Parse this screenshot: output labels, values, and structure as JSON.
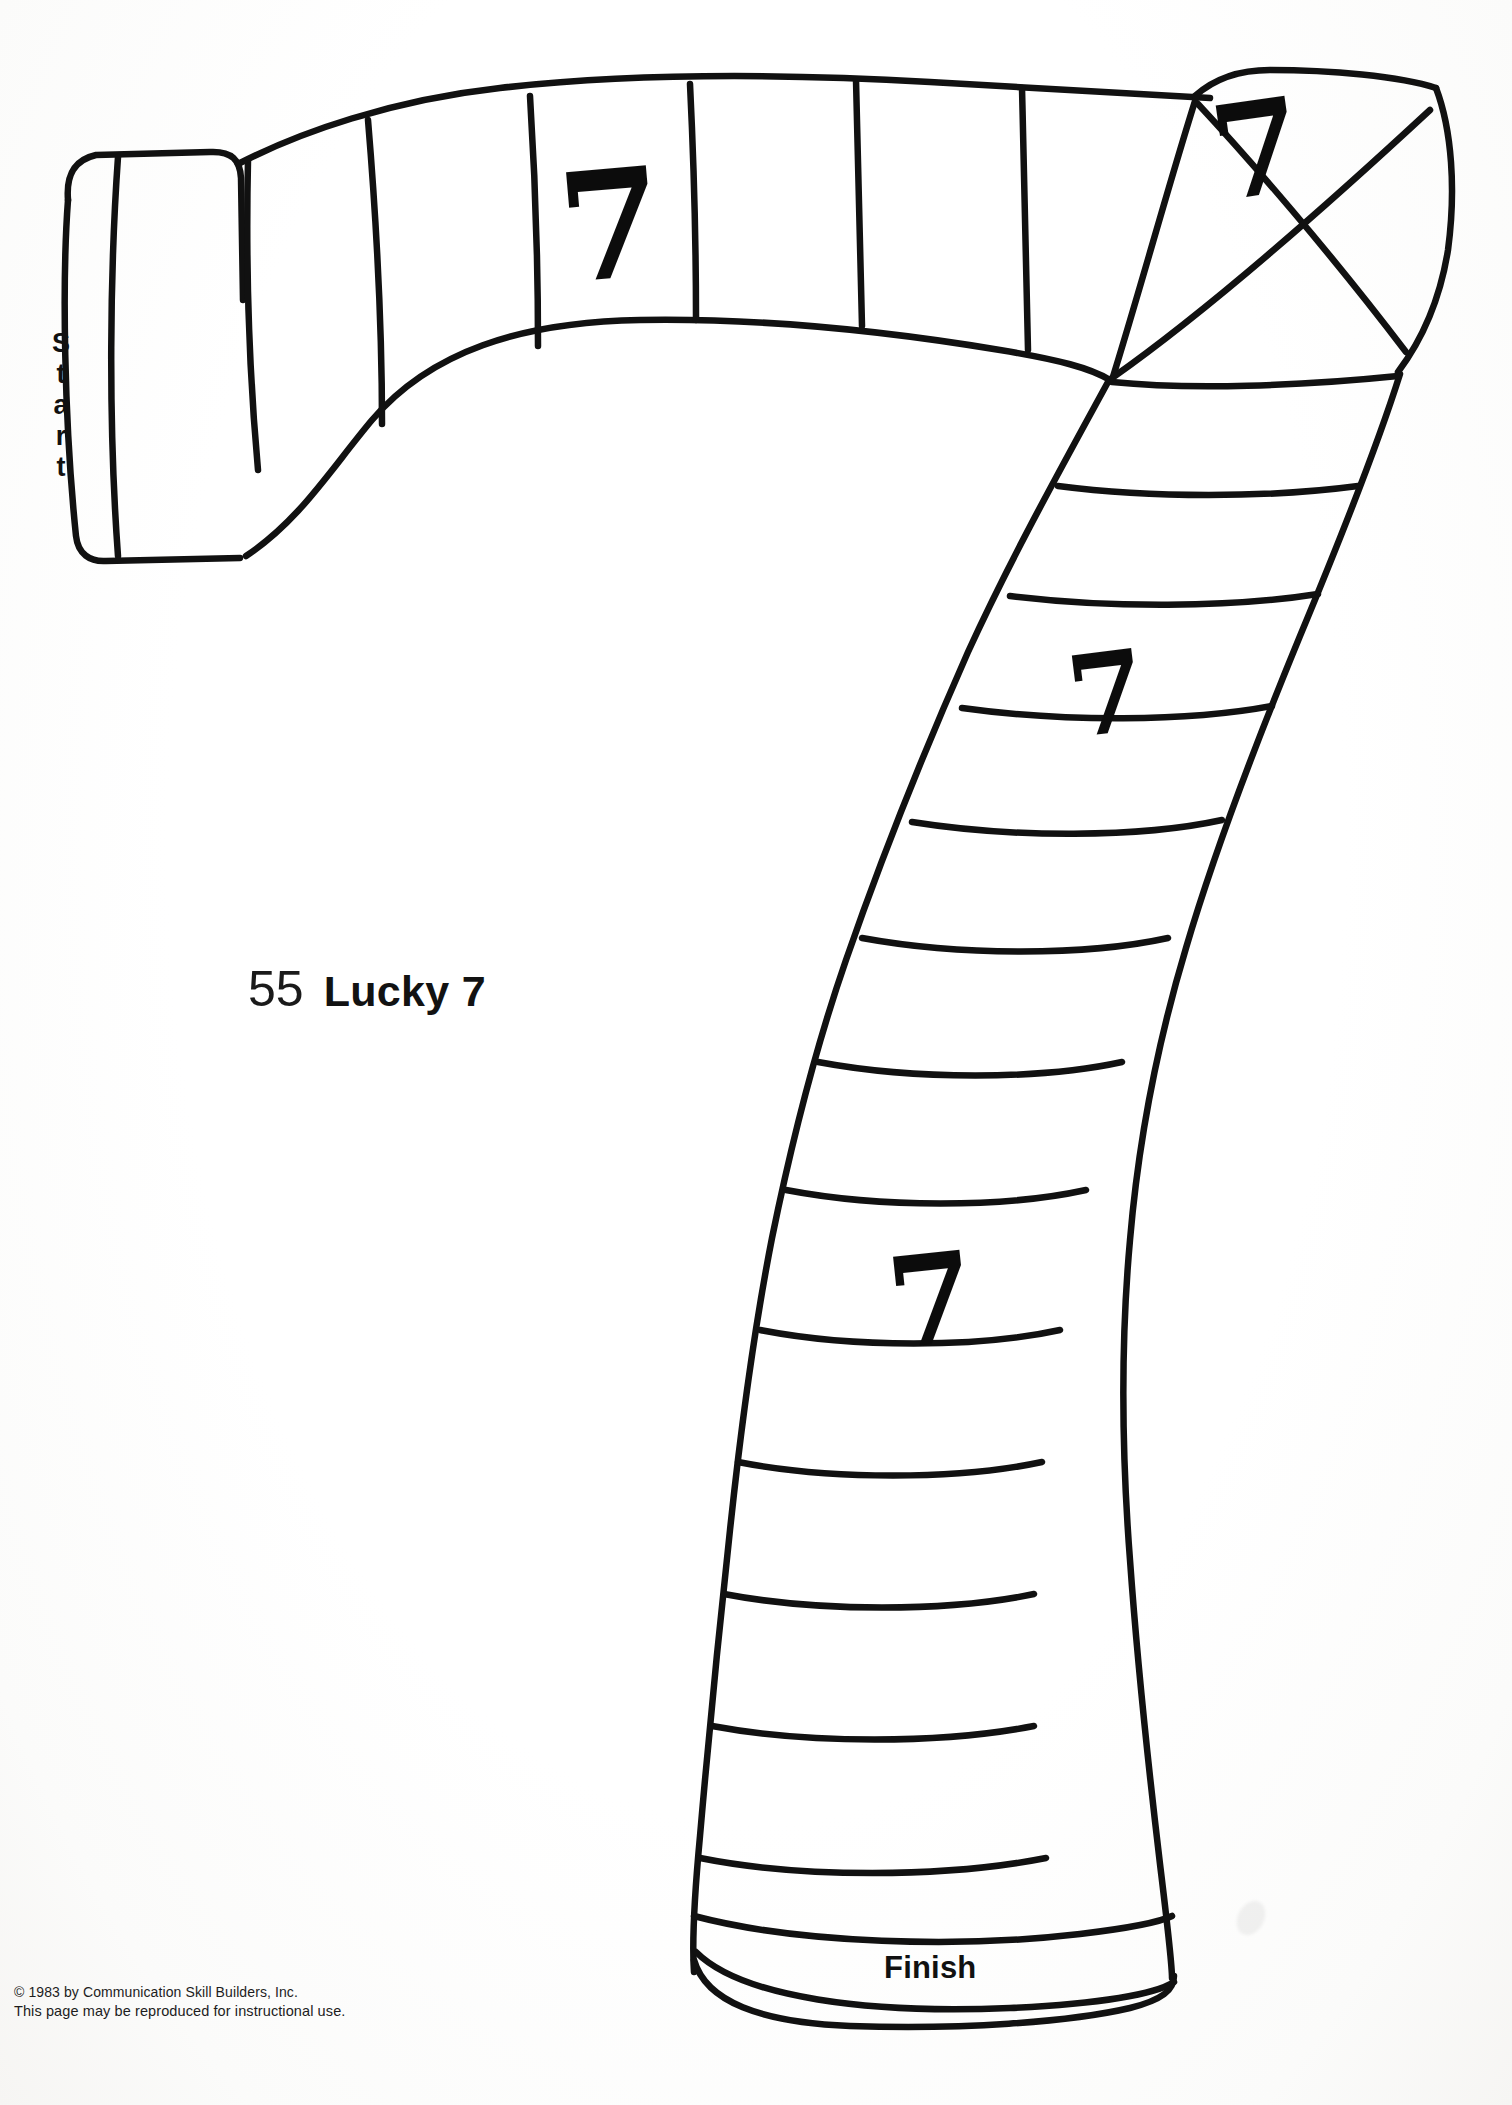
{
  "document": {
    "page_number": "55",
    "title": "Lucky 7",
    "type": "board-game-path-worksheet"
  },
  "board": {
    "start_label": "Start",
    "start_letters": [
      "S",
      "t",
      "a",
      "r",
      "t"
    ],
    "finish_label": "Finish",
    "marker_symbol": "7",
    "marker_count": 4,
    "markers": [
      {
        "id": "seven-1",
        "value": "7",
        "region": "top-path-segment-3"
      },
      {
        "id": "seven-2",
        "value": "7",
        "region": "top-right-corner-segment"
      },
      {
        "id": "seven-3",
        "value": "7",
        "region": "right-descending-segment"
      },
      {
        "id": "seven-4",
        "value": "7",
        "region": "lower-descending-segment"
      }
    ],
    "ink_color": "#111111",
    "paper_color": "#ffffff"
  },
  "footer": {
    "copyright": "© 1983 by Communication Skill Builders, Inc.",
    "permission": "This page may be reproduced for instructional use."
  }
}
